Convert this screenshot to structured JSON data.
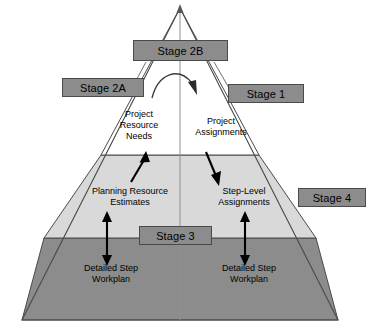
{
  "diagram": {
    "colors": {
      "box_fill": "#8c8c8c",
      "box_stroke": "#4a4a4a",
      "band_top_fill": "#ffffff",
      "band_middle_fill": "#d9d9d9",
      "band_bottom_fill": "#8c8c8c",
      "outline": "#4a4a4a",
      "arrow": "#000000",
      "text": "#000000",
      "background": "#ffffff"
    },
    "stage_boxes": [
      {
        "id": "stage-2b",
        "label": "Stage 2B"
      },
      {
        "id": "stage-2a",
        "label": "Stage 2A"
      },
      {
        "id": "stage-1",
        "label": "Stage 1"
      },
      {
        "id": "stage-4",
        "label": "Stage 4"
      },
      {
        "id": "stage-3",
        "label": "Stage 3"
      }
    ],
    "inner_labels": [
      {
        "id": "project-resource-needs",
        "label": "Project\nResource\nNeeds"
      },
      {
        "id": "project-assignments",
        "label": "Project\nAssignments"
      },
      {
        "id": "planning-resource-estimates",
        "label": "Planning Resource\nEstimates"
      },
      {
        "id": "step-level-assignments",
        "label": "Step-Level\nAssignments"
      },
      {
        "id": "detailed-step-workplan-left",
        "label": "Detailed Step\nWorkplan"
      },
      {
        "id": "detailed-step-workplan-right",
        "label": "Detailed Step\nWorkplan"
      }
    ],
    "bands": [
      {
        "id": "band-top",
        "fill": "#ffffff"
      },
      {
        "id": "band-middle",
        "fill": "#d9d9d9"
      },
      {
        "id": "band-bottom",
        "fill": "#8c8c8c"
      }
    ]
  }
}
